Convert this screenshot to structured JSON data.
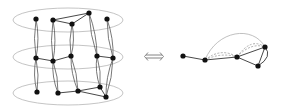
{
  "diagram": {
    "left": {
      "layers": [
        {
          "cx": 68,
          "cy": 20,
          "rx": 55,
          "ry": 12
        },
        {
          "cx": 68,
          "cy": 57,
          "rx": 55,
          "ry": 12
        },
        {
          "cx": 68,
          "cy": 93,
          "rx": 55,
          "ry": 12
        }
      ],
      "nodes": [
        {
          "id": "t1",
          "x": 36,
          "y": 19
        },
        {
          "id": "t2",
          "x": 53,
          "y": 20
        },
        {
          "id": "t3",
          "x": 72,
          "y": 24
        },
        {
          "id": "t4",
          "x": 89,
          "y": 13
        },
        {
          "id": "t5",
          "x": 107,
          "y": 19
        },
        {
          "id": "m1",
          "x": 36,
          "y": 58
        },
        {
          "id": "m2",
          "x": 53,
          "y": 61
        },
        {
          "id": "m3",
          "x": 71,
          "y": 56
        },
        {
          "id": "m4",
          "x": 97,
          "y": 56
        },
        {
          "id": "m5",
          "x": 113,
          "y": 58
        },
        {
          "id": "b1",
          "x": 37,
          "y": 92
        },
        {
          "id": "b2",
          "x": 58,
          "y": 93
        },
        {
          "id": "b3",
          "x": 78,
          "y": 91
        },
        {
          "id": "b4",
          "x": 100,
          "y": 87
        },
        {
          "id": "b5",
          "x": 106,
          "y": 97
        }
      ],
      "intra_edges": [
        [
          "t2",
          "t4"
        ],
        [
          "t2",
          "t3"
        ],
        [
          "t3",
          "t4"
        ],
        [
          "m1",
          "m2"
        ],
        [
          "m2",
          "m3"
        ],
        [
          "m4",
          "m5"
        ],
        [
          "b2",
          "b3"
        ],
        [
          "b3",
          "b4"
        ],
        [
          "b3",
          "b5"
        ],
        [
          "b4",
          "b5"
        ]
      ],
      "inter_edges": [
        [
          "t1",
          "m1"
        ],
        [
          "m1",
          "b1"
        ],
        [
          "t2",
          "m2"
        ],
        [
          "m2",
          "b2"
        ],
        [
          "t3",
          "m3"
        ],
        [
          "m3",
          "b3"
        ],
        [
          "t4",
          "m4"
        ],
        [
          "m4",
          "b4"
        ],
        [
          "t5",
          "m5"
        ],
        [
          "m5",
          "b5"
        ]
      ]
    },
    "equivalence_symbol": "⟺",
    "right": {
      "nodes": [
        {
          "id": "r1",
          "x": 183,
          "y": 56
        },
        {
          "id": "r2",
          "x": 205,
          "y": 60
        },
        {
          "id": "r3",
          "x": 237,
          "y": 57
        },
        {
          "id": "r4",
          "x": 265,
          "y": 47
        },
        {
          "id": "r5",
          "x": 258,
          "y": 66
        }
      ],
      "solid_edges": [
        [
          "r1",
          "r2"
        ],
        [
          "r2",
          "r3"
        ],
        [
          "r3",
          "r4"
        ],
        [
          "r3",
          "r5"
        ],
        [
          "r4",
          "r5"
        ]
      ],
      "dashed_edges": [
        [
          "r2",
          "r3"
        ],
        [
          "r3",
          "r4"
        ]
      ],
      "arc_edges": [
        [
          "r2",
          "r4"
        ]
      ]
    },
    "colors": {
      "node": "#111111",
      "edge": "#333333",
      "layer": "#b5b5b5",
      "dashed": "#9a9a9a"
    }
  }
}
